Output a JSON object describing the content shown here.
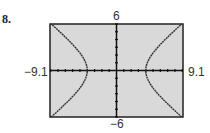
{
  "problem": {
    "number": "8."
  },
  "chart_data": {
    "type": "line",
    "title": "",
    "equation_estimate": "x^2/16 - y^2/9 = 1",
    "xlim": [
      -9.1,
      9.1
    ],
    "ylim": [
      -6,
      6
    ],
    "xscale": 1,
    "yscale": 1,
    "tick_labels": {
      "xmin": "−9.1",
      "xmax": "9.1",
      "ymin": "−6",
      "ymax": "6"
    },
    "grid": false,
    "background": "#d9d9d9",
    "curve_color": "#333333",
    "series": [
      {
        "name": "right branch",
        "vertex": [
          4,
          0
        ],
        "points": [
          [
            8.94,
            6
          ],
          [
            6.4,
            3.75
          ],
          [
            5,
            2.25
          ],
          [
            4.27,
            1.12
          ],
          [
            4,
            0
          ],
          [
            4.27,
            -1.12
          ],
          [
            5,
            -2.25
          ],
          [
            6.4,
            -3.75
          ],
          [
            8.94,
            -6
          ]
        ]
      },
      {
        "name": "left branch",
        "vertex": [
          -4,
          0
        ],
        "points": [
          [
            -8.94,
            6
          ],
          [
            -6.4,
            3.75
          ],
          [
            -5,
            2.25
          ],
          [
            -4.27,
            1.12
          ],
          [
            -4,
            0
          ],
          [
            -4.27,
            -1.12
          ],
          [
            -5,
            -2.25
          ],
          [
            -6.4,
            -3.75
          ],
          [
            -8.94,
            -6
          ]
        ]
      }
    ]
  }
}
